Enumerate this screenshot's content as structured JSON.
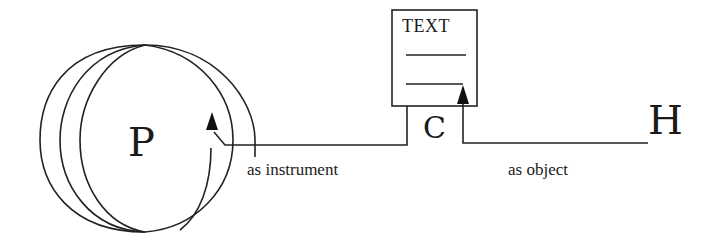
{
  "diagram": {
    "nodes": {
      "p": {
        "label": "P"
      },
      "c": {
        "label": "C"
      },
      "h": {
        "label": "H"
      },
      "text_box": {
        "title": "TEXT"
      }
    },
    "edges": {
      "instrument": {
        "label": "as instrument"
      },
      "object": {
        "label": "as object"
      }
    },
    "colors": {
      "stroke": "#222222",
      "background": "#ffffff"
    }
  }
}
